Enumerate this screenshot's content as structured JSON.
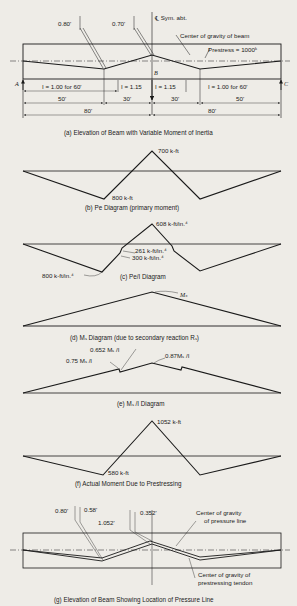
{
  "panel_a": {
    "caption": "(a) Elevation of Beam with Variable Moment of Inertia",
    "ecc_left": "0.80'",
    "ecc_mid": "0.70'",
    "sym": "℄ Sym. abt.",
    "cg_beam": "Center of gravity of beam",
    "prestress": "Prestress = 1000ᵏ",
    "support_left": "A",
    "support_mid": "B",
    "support_right": "C",
    "I_left": "I = 1.00 for 60'",
    "I_mid_left": "I = 1.15",
    "I_mid_right": "I = 1.15",
    "I_right": "I = 1.00 for 60'",
    "dim_50_left": "50'",
    "dim_30_left": "30'",
    "dim_30_right": "30'",
    "dim_50_right": "50'",
    "dim_80_left": "80'",
    "dim_80_right": "80'"
  },
  "panel_b": {
    "caption": "(b) Pe Diagram (primary moment)",
    "peak": "700 k-ft",
    "low": "800 k-ft"
  },
  "panel_c": {
    "caption": "(c) Pe/I Diagram",
    "peak": "608 k-ft/in.⁴",
    "v1": "261 k-ft/in.⁴",
    "v2": "300 k-ft/in.⁴",
    "low": "800 k-ft/in.⁴"
  },
  "panel_d": {
    "caption": "(d) Mₛ Diagram (due to secondary reaction Rₛ)",
    "peak": "Mₛ"
  },
  "panel_e": {
    "caption": "(e) Mₛ /I Diagram",
    "v1": "0.652 Mₛ /I",
    "v2": "0.75 Mₛ /I",
    "v3": "0.87Mₛ /I"
  },
  "panel_f": {
    "caption": "(f) Actual Moment Due to Prestressing",
    "peak": "1052 k-ft",
    "low": "580 k-ft"
  },
  "panel_g": {
    "caption": "(g) Elevation of Beam Showing Location of Pressure Line",
    "d1": "0.80'",
    "d2": "0.58'",
    "d3": "1.052'",
    "d4": "0.352'",
    "cg_pressure": "Center of gravity",
    "cg_pressure2": "of pressure line",
    "cg_tendon": "Center of gravity of",
    "cg_tendon2": "prestressing tendon"
  }
}
